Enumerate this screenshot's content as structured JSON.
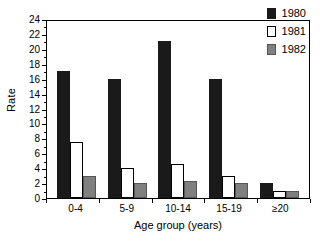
{
  "chart_data": {
    "type": "bar",
    "title": "",
    "subtitle": "",
    "xlabel": "Age group (years)",
    "ylabel": "Rate",
    "categories": [
      "0-4",
      "5-9",
      "10-14",
      "15-19",
      "≥20"
    ],
    "series": [
      {
        "name": "1980",
        "color": "#1a1a1a",
        "values": [
          17,
          16,
          21,
          16,
          2
        ]
      },
      {
        "name": "1981",
        "color": "#ffffff",
        "values": [
          7.5,
          4,
          4.5,
          3,
          1
        ]
      },
      {
        "name": "1982",
        "color": "#808080",
        "values": [
          3,
          2,
          2.3,
          2,
          1
        ]
      }
    ],
    "ylim": [
      0,
      24
    ],
    "ytick_step": 2,
    "ytick_labels": [
      "0",
      "2",
      "4",
      "6",
      "8",
      "10",
      "12",
      "14",
      "16",
      "18",
      "20",
      "22",
      "24"
    ],
    "yticks": [
      0,
      2,
      4,
      6,
      8,
      10,
      12,
      14,
      16,
      18,
      20,
      22,
      24
    ],
    "minor_ticks": true,
    "grid": false,
    "legend_position": "top-right",
    "legend_entries": [
      "1980",
      "1981",
      "1982"
    ],
    "plot_border": true
  },
  "axes": {
    "y_title": "Rate",
    "x_title": "Age group (years)"
  },
  "legend": {
    "items": [
      {
        "label": "1980",
        "swatch": "legend-swatch-black"
      },
      {
        "label": "1981",
        "swatch": "legend-swatch-white"
      },
      {
        "label": "1982",
        "swatch": "legend-swatch-gray"
      }
    ]
  }
}
